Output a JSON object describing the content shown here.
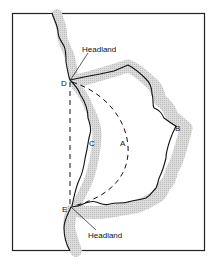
{
  "diagram": {
    "type": "bay-coastline-map",
    "labels": {
      "headland_top": "Headland",
      "headland_bottom": "Headland",
      "point_a": "A",
      "point_b": "B",
      "point_c": "C",
      "point_d": "D",
      "point_e": "E"
    },
    "colors": {
      "frame": "#222222",
      "coastline": "#111111",
      "shore_shading": "#d6d6d6",
      "background": "#ffffff"
    }
  }
}
